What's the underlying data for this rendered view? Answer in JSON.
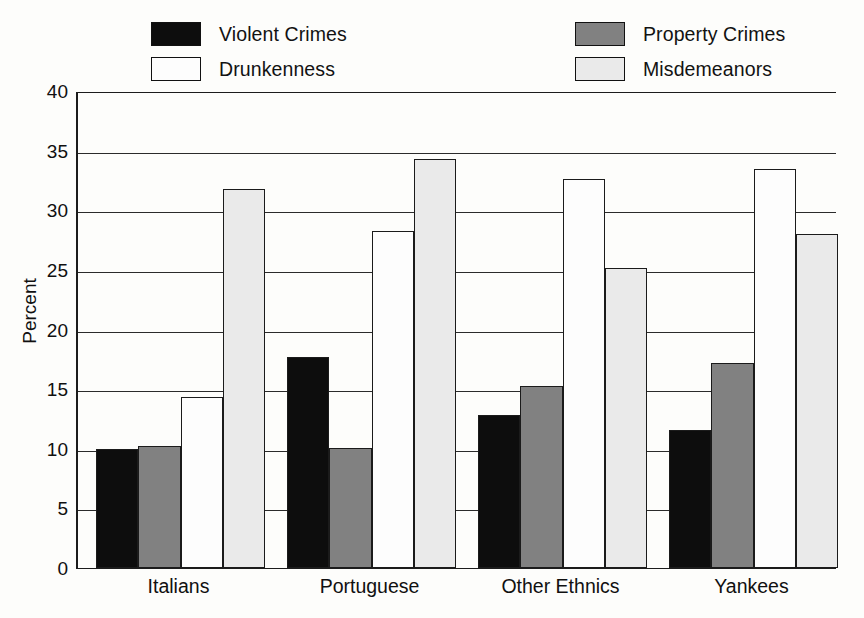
{
  "chart_data": {
    "type": "bar",
    "title": "",
    "xlabel": "",
    "ylabel": "Percent",
    "ylim": [
      0,
      40
    ],
    "yticks": [
      0,
      5,
      10,
      15,
      20,
      25,
      30,
      35,
      40
    ],
    "ytick_labels": [
      "0",
      "5",
      "10",
      "15",
      "20",
      "25",
      "30",
      "35",
      "40"
    ],
    "grid": true,
    "legend_position": "top",
    "categories": [
      "Italians",
      "Portuguese",
      "Other Ethnics",
      "Yankees"
    ],
    "series": [
      {
        "name": "Violent Crimes",
        "color": "#0d0d0d",
        "values": [
          10.0,
          17.7,
          12.8,
          11.6
        ]
      },
      {
        "name": "Property Crimes",
        "color": "#818181",
        "values": [
          10.2,
          10.1,
          15.3,
          17.2
        ]
      },
      {
        "name": "Drunkenness",
        "color": "#fdfdfd",
        "values": [
          14.3,
          28.3,
          32.6,
          33.5
        ]
      },
      {
        "name": "Misdemeanors",
        "color": "#eaeaea",
        "values": [
          31.8,
          34.3,
          25.2,
          28.0
        ]
      }
    ]
  },
  "legend": {
    "items": [
      {
        "label": "Violent Crimes",
        "color": "#0d0d0d"
      },
      {
        "label": "Drunkenness",
        "color": "#fdfdfd"
      },
      {
        "label": "Property Crimes",
        "color": "#818181"
      },
      {
        "label": "Misdemeanors",
        "color": "#eaeaea"
      }
    ]
  },
  "axis": {
    "y_title": "Percent",
    "tick_0": "0",
    "tick_1": "5",
    "tick_2": "10",
    "tick_3": "15",
    "tick_4": "20",
    "tick_5": "25",
    "tick_6": "30",
    "tick_7": "35",
    "tick_8": "40"
  },
  "categories": {
    "c0": "Italians",
    "c1": "Portuguese",
    "c2": "Other Ethnics",
    "c3": "Yankees"
  },
  "colors": {
    "axis": "#1c1c1c",
    "grid": "#2b2b2b",
    "background": "#fdfdfb"
  }
}
